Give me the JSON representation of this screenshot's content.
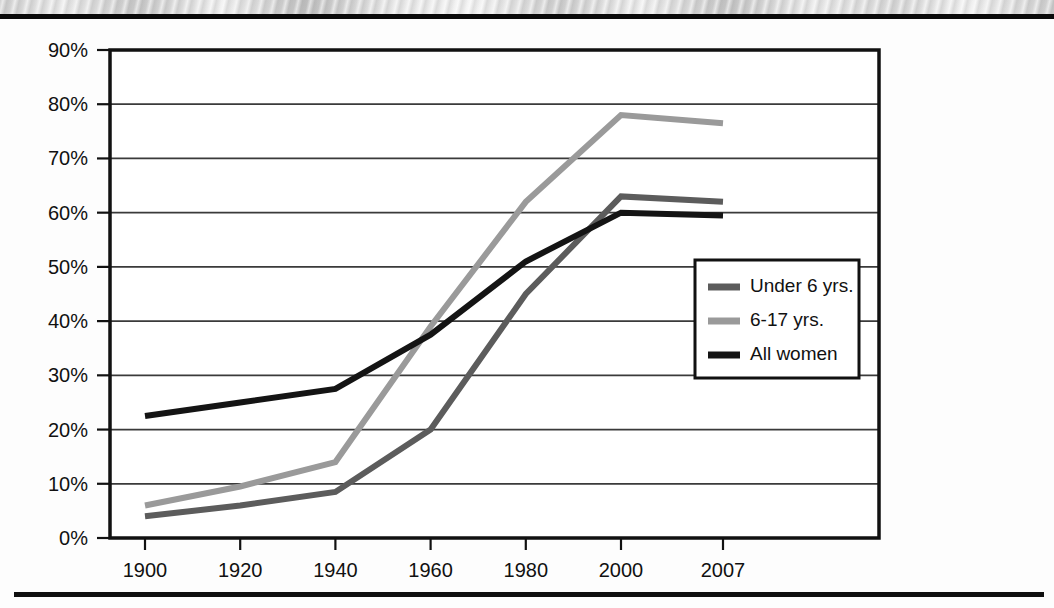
{
  "page": {
    "background_color": "#fdfdfd",
    "rule_color": "#0a0a0a",
    "has_scan_texture": true
  },
  "chart_data": {
    "type": "line",
    "title": "",
    "subtitle": "",
    "xlabel": "",
    "ylabel": "",
    "x": [
      1900,
      1920,
      1940,
      1960,
      1980,
      2000,
      2007
    ],
    "categories": [
      "1900",
      "1920",
      "1940",
      "1960",
      "1980",
      "2000",
      "2007"
    ],
    "xtick_labels": [
      "1900",
      "1920",
      "1940",
      "1960",
      "1980",
      "2000",
      "2007"
    ],
    "ytick_labels": [
      "0%",
      "10%",
      "20%",
      "30%",
      "40%",
      "50%",
      "60%",
      "70%",
      "80%",
      "90%"
    ],
    "ytick_values": [
      0,
      10,
      20,
      30,
      40,
      50,
      60,
      70,
      80,
      90
    ],
    "ylim": [
      0,
      90
    ],
    "xlim": [
      1900,
      2007
    ],
    "grid": "horizontal",
    "legend_position": "center-right-inside",
    "units": "percent",
    "series": [
      {
        "name": "Under 6 yrs.",
        "color": "#5c5c5c",
        "values": [
          4,
          6,
          8.5,
          20,
          45,
          63,
          62
        ]
      },
      {
        "name": "6-17 yrs.",
        "color": "#9a9a9a",
        "values": [
          6,
          9.5,
          14,
          39,
          62,
          78,
          76.5
        ]
      },
      {
        "name": "All women",
        "color": "#141414",
        "values": [
          22.5,
          25,
          27.5,
          37.5,
          51,
          60,
          59.5
        ]
      }
    ]
  },
  "axes": {
    "y_tick_0": "0%",
    "y_tick_10": "10%",
    "y_tick_20": "20%",
    "y_tick_30": "30%",
    "y_tick_40": "40%",
    "y_tick_50": "50%",
    "y_tick_60": "60%",
    "y_tick_70": "70%",
    "y_tick_80": "80%",
    "y_tick_90": "90%",
    "x_tick_0": "1900",
    "x_tick_1": "1920",
    "x_tick_2": "1940",
    "x_tick_3": "1960",
    "x_tick_4": "1980",
    "x_tick_5": "2000",
    "x_tick_6": "2007"
  },
  "legend": {
    "items": [
      {
        "label": "Under 6 yrs.",
        "color": "#5c5c5c"
      },
      {
        "label": "6-17 yrs.",
        "color": "#9a9a9a"
      },
      {
        "label": "All women",
        "color": "#141414"
      }
    ],
    "item_0_label": "Under 6 yrs.",
    "item_1_label": "6-17 yrs.",
    "item_2_label": "All women",
    "border_color": "#111111",
    "background_color": "#ffffff"
  }
}
